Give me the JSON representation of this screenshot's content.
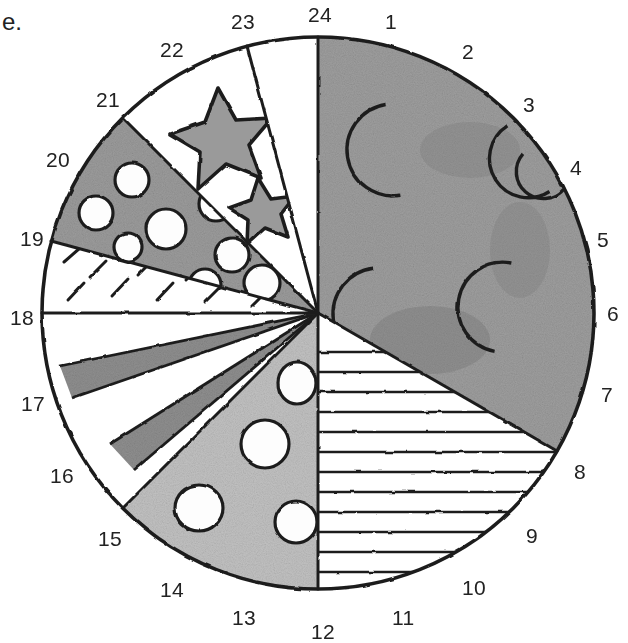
{
  "figure": {
    "corner_label": "e.",
    "kind": "hand-drawn circular pie diagram divided into 24 numbered sectors",
    "center": {
      "x": 318,
      "y": 313
    },
    "radius": 277,
    "tick_count": 24
  },
  "tick_labels": [
    {
      "n": "1",
      "x": 385,
      "y": 10
    },
    {
      "n": "2",
      "x": 462,
      "y": 40
    },
    {
      "n": "3",
      "x": 523,
      "y": 93
    },
    {
      "n": "4",
      "x": 570,
      "y": 156
    },
    {
      "n": "5",
      "x": 597,
      "y": 228
    },
    {
      "n": "6",
      "x": 607,
      "y": 302
    },
    {
      "n": "7",
      "x": 601,
      "y": 383
    },
    {
      "n": "8",
      "x": 574,
      "y": 460
    },
    {
      "n": "9",
      "x": 526,
      "y": 524
    },
    {
      "n": "10",
      "x": 462,
      "y": 576
    },
    {
      "n": "11",
      "x": 392,
      "y": 606
    },
    {
      "n": "12",
      "x": 311,
      "y": 620
    },
    {
      "n": "13",
      "x": 232,
      "y": 606
    },
    {
      "n": "14",
      "x": 160,
      "y": 578
    },
    {
      "n": "15",
      "x": 98,
      "y": 527
    },
    {
      "n": "16",
      "x": 50,
      "y": 464
    },
    {
      "n": "17",
      "x": 21,
      "y": 392
    },
    {
      "n": "18",
      "x": 10,
      "y": 306
    },
    {
      "n": "19",
      "x": 20,
      "y": 227
    },
    {
      "n": "20",
      "x": 46,
      "y": 148
    },
    {
      "n": "21",
      "x": 96,
      "y": 88
    },
    {
      "n": "22",
      "x": 160,
      "y": 38
    },
    {
      "n": "23",
      "x": 231,
      "y": 10
    },
    {
      "n": "24",
      "x": 308,
      "y": 3
    }
  ],
  "sectors": [
    {
      "id": "moons-half",
      "name": "crescent-moons-sector",
      "from_tick": 24,
      "to_tick": 10,
      "fill": "mid-gray",
      "motif": "crescent moons",
      "motif_count": 6
    },
    {
      "id": "horizontal-lines",
      "name": "horizontal-lines-sector",
      "from_tick": 10,
      "to_tick": 12,
      "fill": "white",
      "motif": "horizontal hatch lines"
    },
    {
      "id": "dots-lower",
      "name": "dotted-sector-lower",
      "from_tick": 12,
      "to_tick": 15,
      "fill": "light-gray",
      "motif": "open circles",
      "motif_count": 6
    },
    {
      "id": "stripes",
      "name": "radial-stripes-sector",
      "from_tick": 15,
      "to_tick": 18,
      "fill": "white",
      "motif": "alternating gray radial stripes",
      "stripe_count": 4
    },
    {
      "id": "dashes",
      "name": "dashed-sector",
      "from_tick": 18,
      "to_tick": 19,
      "fill": "white",
      "motif": "short diagonal dashes"
    },
    {
      "id": "dots-upper",
      "name": "dotted-sector-upper",
      "from_tick": 19,
      "to_tick": 21,
      "fill": "mid-gray",
      "motif": "open circles",
      "motif_count": 9
    },
    {
      "id": "stars",
      "name": "stars-sector",
      "from_tick": 21,
      "to_tick": 23,
      "fill": "white",
      "motif": "gray five-pointed stars",
      "motif_count": 2
    },
    {
      "id": "blank",
      "name": "blank-sector",
      "from_tick": 23,
      "to_tick": 24,
      "fill": "white",
      "motif": "none"
    }
  ],
  "colors": {
    "ink": "#1e1e1e",
    "mid_gray": "#9a9a9a",
    "dark_gray": "#8d8d8d",
    "light_gray": "#bdbdbd",
    "white": "#ffffff",
    "background": "#ffffff"
  }
}
